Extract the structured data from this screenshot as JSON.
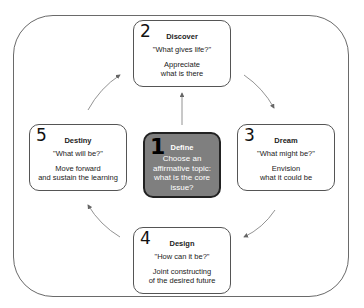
{
  "diagram": {
    "boxes": [
      {
        "id": "define",
        "number": "1",
        "title": "Define",
        "question": "",
        "description": "Choose an affirmative topic: what is the core issue?"
      },
      {
        "id": "discover",
        "number": "2",
        "title": "Discover",
        "question": "\"What gives life?\"",
        "description_lines": [
          "Appreciate",
          "what is there"
        ]
      },
      {
        "id": "dream",
        "number": "3",
        "title": "Dream",
        "question": "\"What might be?\"",
        "description_lines": [
          "Envision",
          "what it could be"
        ]
      },
      {
        "id": "design",
        "number": "4",
        "title": "Design",
        "question": "\"How can it be?\"",
        "description_lines": [
          "Joint constructing",
          "of the desired future"
        ]
      },
      {
        "id": "destiny",
        "number": "5",
        "title": "Destiny",
        "question": "\"What will be?\"",
        "description_lines": [
          "Move forward",
          "and sustain the learning"
        ]
      }
    ],
    "flow": [
      "define->discover",
      "discover->dream",
      "dream->design",
      "design->destiny",
      "destiny->discover"
    ],
    "colors": {
      "define_fill": "#7f7f7f",
      "box_border": "#555555",
      "frame_border": "#6a6a6a",
      "arrow": "#666666"
    }
  }
}
